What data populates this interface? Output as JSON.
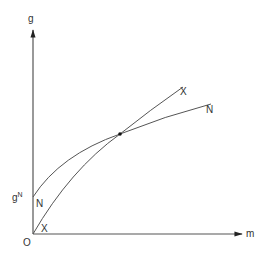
{
  "diagram": {
    "axes": {
      "y_label": "g",
      "x_label": "m",
      "origin_label": "O"
    },
    "curves": [
      {
        "name": "N",
        "start_label": "N",
        "end_label": "N",
        "description": "concave curve starting at g^N on the vertical axis"
      },
      {
        "name": "X",
        "start_label": "X",
        "end_label": "X",
        "description": "concave curve starting at the origin, steeper, crossing N"
      }
    ],
    "intercept_label": "g",
    "intercept_superscript": "N",
    "intersection": {
      "marked": true
    },
    "colors": {
      "line": "#555555",
      "text": "#333333",
      "background": "#ffffff"
    }
  }
}
